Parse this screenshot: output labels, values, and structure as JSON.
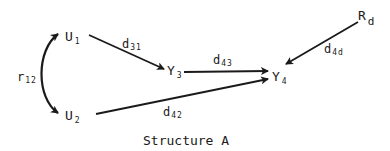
{
  "diagram": {
    "caption": "Structure A",
    "nodes": [
      {
        "id": "U1",
        "base": "U",
        "sub": "1"
      },
      {
        "id": "U2",
        "base": "U",
        "sub": "2"
      },
      {
        "id": "Y3",
        "base": "Y",
        "sub": "3"
      },
      {
        "id": "Y4",
        "base": "Y",
        "sub": "4"
      },
      {
        "id": "Rd",
        "base": "R",
        "sub": "d"
      }
    ],
    "edges": [
      {
        "from": "U1",
        "to": "U2",
        "type": "double-headed-curve",
        "label_base": "r",
        "label_sub": "12"
      },
      {
        "from": "U1",
        "to": "Y3",
        "type": "arrow",
        "label_base": "d",
        "label_sub": "31"
      },
      {
        "from": "Y3",
        "to": "Y4",
        "type": "arrow",
        "label_base": "d",
        "label_sub": "43"
      },
      {
        "from": "U2",
        "to": "Y4",
        "type": "arrow",
        "label_base": "d",
        "label_sub": "42"
      },
      {
        "from": "Rd",
        "to": "Y4",
        "type": "arrow",
        "label_base": "d",
        "label_sub": "4d"
      }
    ]
  }
}
